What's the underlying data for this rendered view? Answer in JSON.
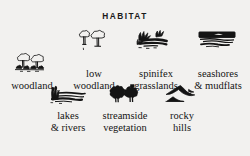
{
  "legend": {
    "title": "HABITAT",
    "background_color": "#f2f1ef",
    "ink_color": "#141414",
    "rows": [
      {
        "items": [
          {
            "icon": "woodland-trees-icon",
            "label": "woodland"
          },
          {
            "icon": "low-woodland-trees-icon",
            "label": "low\nwoodland"
          },
          {
            "icon": "spinifex-grass-tufts-icon",
            "label": "spinifex\ngrasslands"
          },
          {
            "icon": "seashore-mudflat-horizon-icon",
            "label": "seashores\n& mudflats"
          }
        ]
      },
      {
        "items": [
          {
            "icon": "lake-river-reeds-icon",
            "label": "lakes\n& rivers"
          },
          {
            "icon": "streamside-shrubs-icon",
            "label": "streamside\nvegetation"
          },
          {
            "icon": "rocky-hills-peaks-icon",
            "label": "rocky\nhills"
          }
        ]
      }
    ]
  }
}
